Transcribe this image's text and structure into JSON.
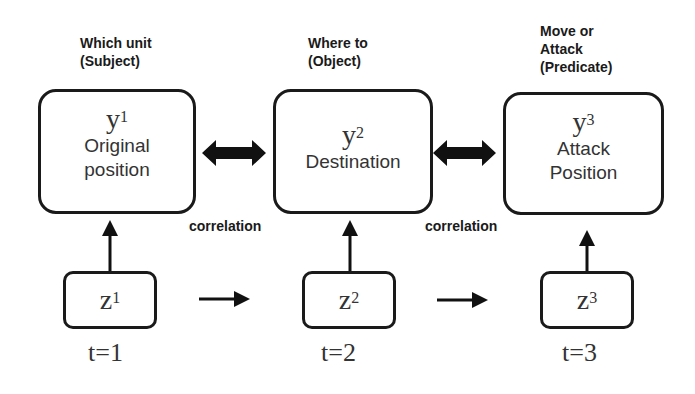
{
  "headers": [
    {
      "line1": "Which unit",
      "line2": "(Subject)",
      "line3": ""
    },
    {
      "line1": "Where to",
      "line2": "(Object)",
      "line3": ""
    },
    {
      "line1": "Move or",
      "line2": "Attack",
      "line3": "(Predicate)"
    }
  ],
  "y_nodes": [
    {
      "var": "y",
      "sup": "1",
      "desc1": "Original",
      "desc2": "position"
    },
    {
      "var": "y",
      "sup": "2",
      "desc1": "Destination",
      "desc2": ""
    },
    {
      "var": "y",
      "sup": "3",
      "desc1": "Attack",
      "desc2": "Position"
    }
  ],
  "z_nodes": [
    {
      "var": "z",
      "sup": "1"
    },
    {
      "var": "z",
      "sup": "2"
    },
    {
      "var": "z",
      "sup": "3"
    }
  ],
  "time_labels": [
    "t=1",
    "t=2",
    "t=3"
  ],
  "correlation_labels": [
    "correlation",
    "correlation"
  ],
  "edges": {
    "double_arrows": [
      "y1<->y2",
      "y2<->y3"
    ],
    "vertical_arrows": [
      "z1->y1",
      "z2->y2",
      "z3->y3"
    ],
    "temporal_arrows": [
      "z1->z2",
      "z2->z3"
    ]
  },
  "colors": {
    "stroke": "#1a1a1a",
    "text": "#333333",
    "background": "#ffffff"
  }
}
